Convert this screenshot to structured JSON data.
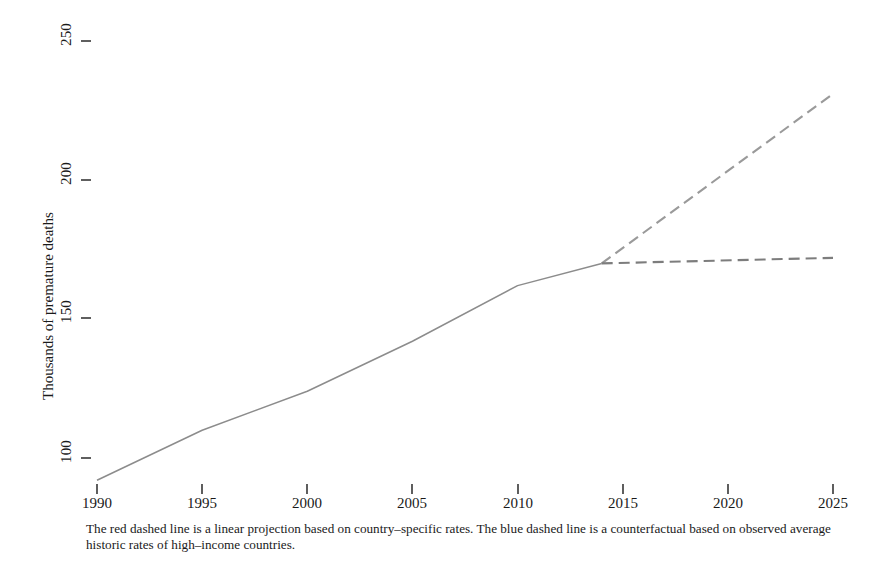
{
  "chart_data": {
    "type": "line",
    "title": "",
    "xlabel": "",
    "ylabel": "Thousands of premature deaths",
    "xlim": [
      1990,
      2025
    ],
    "ylim": [
      88,
      252
    ],
    "xticks": [
      1990,
      1995,
      2000,
      2005,
      2010,
      2015,
      2020,
      2025
    ],
    "yticks": [
      100,
      150,
      200,
      250
    ],
    "grid": false,
    "legend": "none",
    "series": [
      {
        "name": "Observed premature deaths",
        "style": "solid",
        "color": "#8c8c8c",
        "x": [
          1990,
          1995,
          2000,
          2005,
          2010,
          2014
        ],
        "values": [
          92,
          110,
          124,
          142,
          162,
          170
        ]
      },
      {
        "name": "Linear projection based on country-specific rates",
        "style": "dashed",
        "color": "#9a9a9a",
        "x": [
          2014,
          2025
        ],
        "values": [
          170,
          231
        ]
      },
      {
        "name": "Counterfactual based on observed average historic rates of high-income countries",
        "style": "dashed",
        "color": "#7d7d7d",
        "x": [
          2014,
          2025
        ],
        "values": [
          170,
          172
        ]
      }
    ],
    "annotations": {
      "caption": "The red dashed line is a linear projection based on country–specific rates. The blue dashed line is a counterfactual based on observed average historic rates of high–income countries."
    }
  },
  "axes": {
    "y_title": "Thousands of premature deaths",
    "y_tick_labels": [
      "100",
      "150",
      "200",
      "250"
    ],
    "x_tick_labels": [
      "1990",
      "1995",
      "2000",
      "2005",
      "2010",
      "2015",
      "2020",
      "2025"
    ]
  },
  "caption": {
    "text": "The red dashed line is a linear projection based on country–specific rates. The blue dashed line is a counterfactual based on observed average historic rates of high–income countries."
  },
  "colors": {
    "solid_line": "#8c8c8c",
    "projection_line": "#9a9a9a",
    "counterfactual_line": "#7d7d7d",
    "text": "#1a1a1a",
    "background": "#ffffff"
  }
}
